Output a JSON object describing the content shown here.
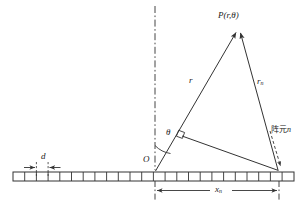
{
  "figure": {
    "title": "",
    "type": "antenna-array-geometry-diagram",
    "labels": {
      "far_field_point": "P(r,θ)",
      "range_from_origin": "r",
      "range_from_element": "r",
      "range_from_element_sub": "n",
      "angle": "θ",
      "origin": "O",
      "element_spacing": "d",
      "element_position": "x",
      "element_position_sub": "n",
      "element_annotation_cjk": "阵元",
      "element_annotation_index": "n"
    },
    "colors": {
      "stroke": "#333333",
      "axis": "#444444",
      "background": "#ffffff",
      "element_fill": "#ffffff"
    },
    "array": {
      "element_count": 24,
      "bar_left_x": 13,
      "bar_right_x": 294,
      "bar_top_y": 172,
      "bar_height": 9,
      "origin_x": 155,
      "element_n_x": 279
    },
    "geometry": {
      "point_P": [
        238,
        30
      ],
      "origin": [
        155,
        172
      ],
      "element_n": [
        279,
        172
      ],
      "axis_line_x": 155,
      "axis_top_y": 6,
      "theta_arc_radius": 26
    }
  }
}
